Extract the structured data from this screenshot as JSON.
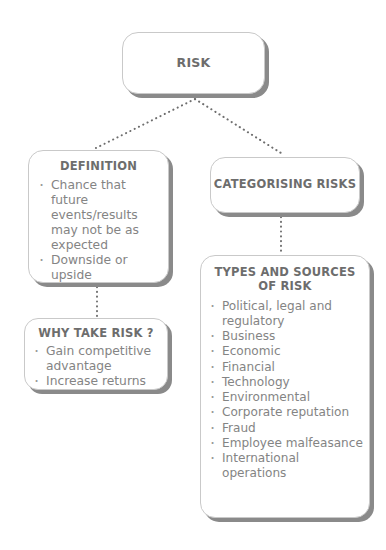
{
  "diagram": {
    "palette": {
      "background": "#ffffff",
      "node_fill": "#ffffff",
      "node_border": "#c9c9c9",
      "node_shadow": "#8a8a8a",
      "title_text": "#6d6d6d",
      "body_text": "#848484",
      "connector": "#6e6e6e"
    },
    "nodes": {
      "risk": {
        "title": "RISK"
      },
      "definition": {
        "title": "DEFINITION",
        "bullets": [
          "Chance that future events/results may not be as expected",
          "Downside or upside"
        ]
      },
      "why_take_risk": {
        "title": "WHY TAKE RISK ?",
        "bullets": [
          "Gain competitive advantage",
          "Increase returns"
        ]
      },
      "categorising_risks": {
        "title": "CATEGORISING RISKS"
      },
      "types_and_sources": {
        "title": "TYPES AND SOURCES OF RISK",
        "bullets": [
          "Political, legal and regulatory",
          "Business",
          "Economic",
          "Financial",
          "Technology",
          "Environmental",
          "Corporate reputation",
          "Fraud",
          "Employee malfeasance",
          "International operations"
        ]
      }
    },
    "connectors": [
      {
        "name": "risk-to-definition",
        "style": "dotted"
      },
      {
        "name": "risk-to-categorising-risks",
        "style": "dotted"
      },
      {
        "name": "definition-to-why-take-risk",
        "style": "dotted"
      },
      {
        "name": "categorising-risks-to-types-and-sources",
        "style": "dotted"
      }
    ]
  }
}
